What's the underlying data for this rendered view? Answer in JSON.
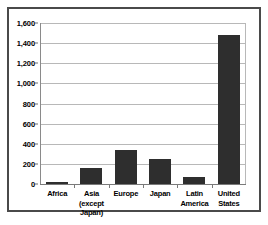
{
  "chart_data": {
    "type": "bar",
    "title": "",
    "xlabel": "",
    "ylabel": "",
    "categories": [
      "Africa",
      "Asia (except Japan)",
      "Europe",
      "Japan",
      "Latin America",
      "United States"
    ],
    "category_lines": [
      [
        "Africa"
      ],
      [
        "Asia",
        "(except",
        "Japan)"
      ],
      [
        "Europe"
      ],
      [
        "Japan"
      ],
      [
        "Latin",
        "America"
      ],
      [
        "United",
        "States"
      ]
    ],
    "values": [
      20,
      160,
      335,
      250,
      70,
      1480
    ],
    "ylim": [
      0,
      1600
    ],
    "ytick_values": [
      0,
      200,
      400,
      600,
      800,
      1000,
      1200,
      1400,
      1600
    ],
    "ytick_labels": [
      "0",
      "200",
      "400",
      "600",
      "800",
      "1,000",
      "1,200",
      "1,400",
      "1,600"
    ],
    "grid": true,
    "legend": "none",
    "bar_color": "#2e2e2e",
    "gridline_color": "#b8b8b8",
    "background_color": "#ffffff",
    "frame_color": "#4a4a4a"
  }
}
